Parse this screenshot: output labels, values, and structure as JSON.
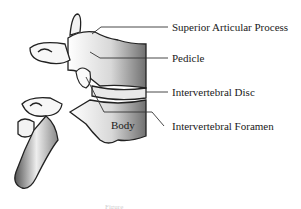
{
  "diagram": {
    "labels": [
      {
        "id": "superior-articular-process",
        "text": "Superior Articular Process"
      },
      {
        "id": "pedicle",
        "text": "Pedicle"
      },
      {
        "id": "intervertebral-disc",
        "text": "Intervertebral Disc"
      },
      {
        "id": "intervertebral-foramen",
        "text": "Intervertebral Foramen"
      }
    ],
    "inline_labels": [
      {
        "id": "body",
        "text": "Body"
      }
    ],
    "caption": "Figure"
  }
}
